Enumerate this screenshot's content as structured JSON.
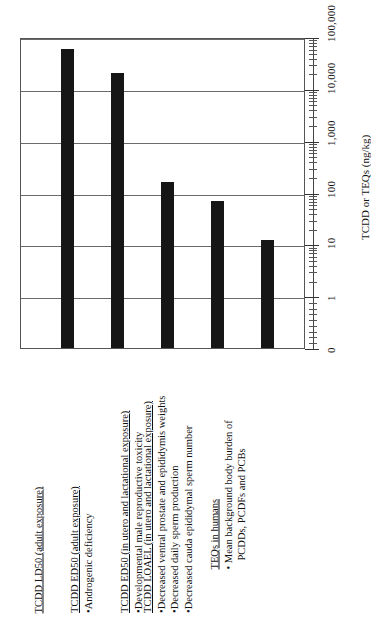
{
  "chart_data": {
    "type": "bar",
    "title": "",
    "xlabel": "",
    "ylabel": "TCDD or TEQs (ng/kg)",
    "scale": "log",
    "grid": true,
    "legend": null,
    "ylim": [
      0,
      100000
    ],
    "tick_labels": [
      "0",
      "1",
      "10",
      "100",
      "1,000",
      "10,000",
      "100,000"
    ],
    "tick_values": [
      0,
      1,
      10,
      100,
      1000,
      10000,
      100000
    ],
    "categories": [
      "TCDD LD50 (adult exposure)",
      "TCDD ED50 (adult exposure)",
      "TCDD ED50 (in utero and lactational exposure)",
      "TCDD LOAEL (in utero and lactational exposure)",
      "TEQs in humans"
    ],
    "values": [
      60000,
      20000,
      160,
      70,
      12
    ],
    "bar_color": "#161616"
  },
  "axis": {
    "title": "TCDD or TEQs (ng/kg)",
    "ticks": [
      {
        "label": "100,000",
        "value": 100000
      },
      {
        "label": "10,000",
        "value": 10000
      },
      {
        "label": "1,000",
        "value": 1000
      },
      {
        "label": "100",
        "value": 100
      },
      {
        "label": "10",
        "value": 10
      },
      {
        "label": "1",
        "value": 1
      },
      {
        "label": "0",
        "value": 0
      }
    ]
  },
  "categories": [
    {
      "id": "tcdd-ld50-adult",
      "heading": "TCDD LD50 (adult exposure)",
      "bullets": []
    },
    {
      "id": "tcdd-ed50-adult",
      "heading": "TCDD ED50 (adult exposure)",
      "bullets": [
        "•Androgenic deficiency"
      ]
    },
    {
      "id": "tcdd-ed50-utero",
      "heading": "TCDD ED50 (in utero and lactational exposure)",
      "bullets": [
        "•Developmental male reproductive toxicity"
      ]
    },
    {
      "id": "tcdd-loael-utero",
      "heading": "TCDD LOAEL (in utero and lactational exposure)",
      "bullets": [
        "•Decreased ventral prostate and epididymis weights",
        "•Decreased daily sperm production",
        "•Decreased cauda epididymal sperm number"
      ]
    },
    {
      "id": "teqs-in-humans",
      "heading": "TEQs in humans",
      "bullets": [
        "• Mean background body burden of",
        "PCDDs, PCDFs and PCBs"
      ]
    }
  ],
  "colors": {
    "bar": "#161616",
    "grid": "#6a6a6a",
    "frame": "#555555",
    "text": "#111111",
    "background": "#ffffff"
  }
}
